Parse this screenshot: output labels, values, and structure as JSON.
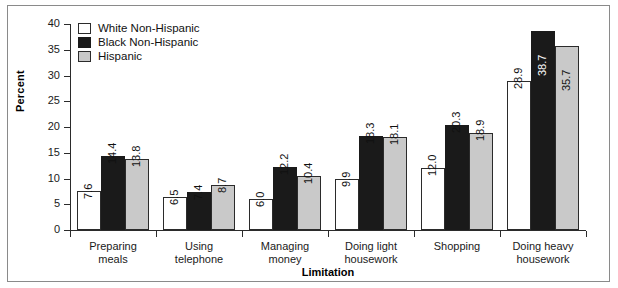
{
  "chart_data": {
    "type": "bar",
    "title": "",
    "xlabel": "Limitation",
    "ylabel": "Percent",
    "ylim": [
      0,
      40
    ],
    "ytick_labels": [
      "0",
      "5",
      "10",
      "15",
      "20",
      "25",
      "30",
      "35",
      "40"
    ],
    "ytick_values": [
      0,
      5,
      10,
      15,
      20,
      25,
      30,
      35,
      40
    ],
    "grid": false,
    "legend_position": "top-left",
    "categories": [
      "Preparing meals",
      "Using telephone",
      "Managing money",
      "Doing light housework",
      "Shopping",
      "Doing heavy housework"
    ],
    "series": [
      {
        "name": "White Non-Hispanic",
        "color": "#ffffff",
        "values": [
          7.6,
          6.5,
          6.0,
          9.9,
          12.0,
          28.9
        ],
        "labels": [
          "7.6",
          "6.5",
          "6.0",
          "9.9",
          "12.0",
          "28.9"
        ]
      },
      {
        "name": "Black Non-Hispanic",
        "color": "#1a1a1a",
        "values": [
          14.4,
          7.4,
          12.2,
          18.3,
          20.3,
          38.7
        ],
        "labels": [
          "14.4",
          "7.4",
          "12.2",
          "18.3",
          "20.3",
          "38.7"
        ]
      },
      {
        "name": "Hispanic",
        "color": "#c9c9c9",
        "values": [
          13.8,
          8.7,
          10.4,
          18.1,
          18.9,
          35.7
        ],
        "labels": [
          "13.8",
          "8.7",
          "10.4",
          "18.1",
          "18.9",
          "35.7"
        ]
      }
    ]
  },
  "axis": {
    "y_title": "Percent",
    "x_title": "Limitation"
  },
  "legend": {
    "items": [
      {
        "label": "White Non-Hispanic",
        "swatch": "white"
      },
      {
        "label": "Black Non-Hispanic",
        "swatch": "black"
      },
      {
        "label": "Hispanic",
        "swatch": "gray"
      }
    ]
  },
  "category_lines": [
    [
      "Preparing",
      "meals"
    ],
    [
      "Using",
      "telephone"
    ],
    [
      "Managing",
      "money"
    ],
    [
      "Doing light",
      "housework"
    ],
    [
      "Shopping",
      ""
    ],
    [
      "Doing heavy",
      "housework"
    ]
  ]
}
